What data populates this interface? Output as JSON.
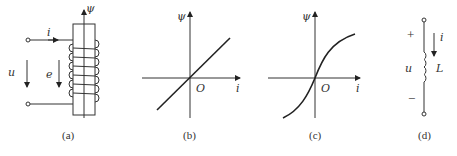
{
  "figure": {
    "panels": [
      {
        "id": "a",
        "caption": "(a)",
        "labels": {
          "flux": "ψ",
          "current": "i",
          "voltage": "u",
          "emf": "e"
        },
        "description": "coil wound on core with terminals"
      },
      {
        "id": "b",
        "caption": "(b)",
        "labels": {
          "y": "ψ",
          "x": "i",
          "origin": "O"
        },
        "description": "linear ψ-i characteristic"
      },
      {
        "id": "c",
        "caption": "(c)",
        "labels": {
          "y": "ψ",
          "x": "i",
          "origin": "O"
        },
        "description": "nonlinear saturating ψ-i characteristic"
      },
      {
        "id": "d",
        "caption": "(d)",
        "labels": {
          "plus": "+",
          "minus": "−",
          "voltage": "u",
          "current": "i",
          "inductor": "L"
        },
        "description": "inductor circuit symbol"
      }
    ]
  }
}
